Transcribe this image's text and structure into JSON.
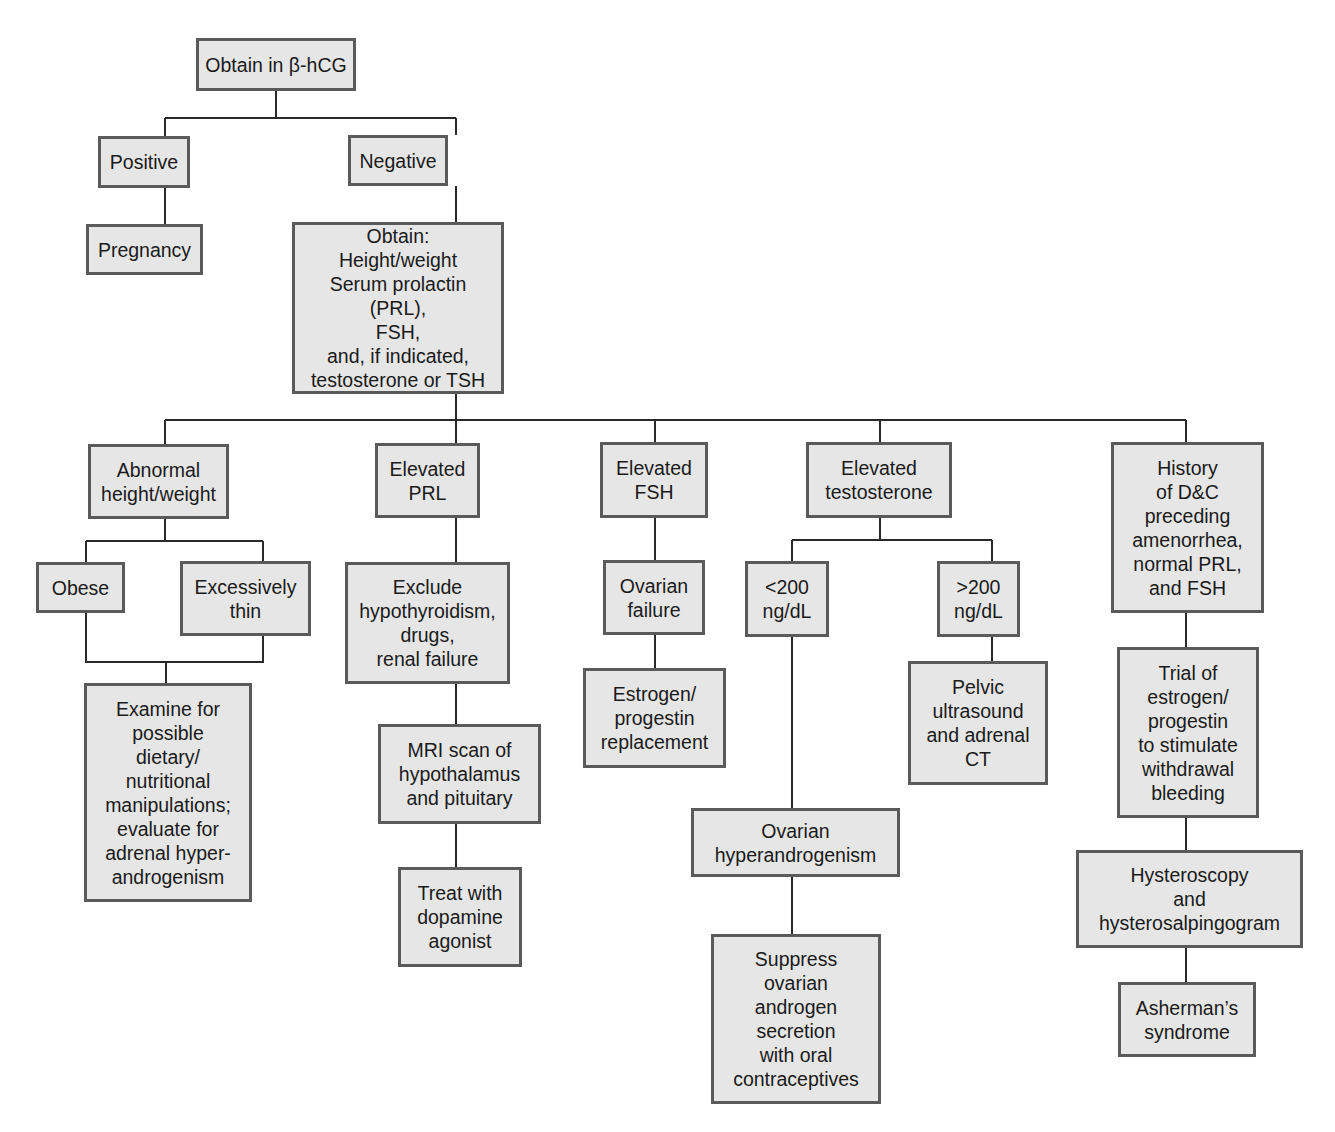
{
  "nodes": [
    {
      "id": "start",
      "text": "Obtain in β-hCG",
      "x": 196,
      "y": 38,
      "w": 160,
      "h": 53
    },
    {
      "id": "positive",
      "text": "Positive",
      "x": 98,
      "y": 136,
      "w": 92,
      "h": 52
    },
    {
      "id": "negative",
      "text": "Negative",
      "x": 348,
      "y": 135,
      "w": 100,
      "h": 51
    },
    {
      "id": "pregnancy",
      "text": "Pregnancy",
      "x": 86,
      "y": 224,
      "w": 117,
      "h": 51
    },
    {
      "id": "obtain",
      "text": "Obtain:\nHeight/weight\nSerum prolactin (PRL),\nFSH,\nand, if indicated,\ntestosterone or TSH",
      "x": 292,
      "y": 222,
      "w": 212,
      "h": 172
    },
    {
      "id": "abnormal",
      "text": "Abnormal\nheight/weight",
      "x": 88,
      "y": 444,
      "w": 141,
      "h": 75
    },
    {
      "id": "elevated-prl",
      "text": "Elevated\nPRL",
      "x": 375,
      "y": 443,
      "w": 105,
      "h": 75
    },
    {
      "id": "elevated-fsh",
      "text": "Elevated\nFSH",
      "x": 600,
      "y": 442,
      "w": 108,
      "h": 76
    },
    {
      "id": "elevated-testosterone",
      "text": "Elevated\ntestosterone",
      "x": 806,
      "y": 442,
      "w": 146,
      "h": 76
    },
    {
      "id": "history-dc",
      "text": "History\nof D&C\npreceding\namenorrhea,\nnormal PRL,\nand FSH",
      "x": 1111,
      "y": 442,
      "w": 153,
      "h": 171
    },
    {
      "id": "obese",
      "text": "Obese",
      "x": 36,
      "y": 562,
      "w": 89,
      "h": 51
    },
    {
      "id": "thin",
      "text": "Excessively\nthin",
      "x": 180,
      "y": 561,
      "w": 131,
      "h": 75
    },
    {
      "id": "exclude",
      "text": "Exclude\nhypothyroidism,\ndrugs,\nrenal failure",
      "x": 345,
      "y": 562,
      "w": 165,
      "h": 122
    },
    {
      "id": "ovarian-failure",
      "text": "Ovarian\nfailure",
      "x": 603,
      "y": 560,
      "w": 102,
      "h": 75
    },
    {
      "id": "lt200",
      "text": "<200\nng/dL",
      "x": 745,
      "y": 561,
      "w": 84,
      "h": 76
    },
    {
      "id": "gt200",
      "text": ">200\nng/dL",
      "x": 937,
      "y": 561,
      "w": 83,
      "h": 76
    },
    {
      "id": "estrogen-replacement",
      "text": "Estrogen/\nprogestin\nreplacement",
      "x": 583,
      "y": 668,
      "w": 143,
      "h": 100
    },
    {
      "id": "pelvic",
      "text": "Pelvic\nultrasound\nand adrenal\nCT",
      "x": 908,
      "y": 661,
      "w": 140,
      "h": 124
    },
    {
      "id": "trial",
      "text": "Trial of\nestrogen/\nprogestin\nto stimulate\nwithdrawal\nbleeding",
      "x": 1117,
      "y": 647,
      "w": 142,
      "h": 171
    },
    {
      "id": "examine",
      "text": "Examine for\npossible\ndietary/\nnutritional\nmanipulations;\nevaluate for\nadrenal hyper-\nandrogenism",
      "x": 84,
      "y": 683,
      "w": 168,
      "h": 219
    },
    {
      "id": "mri",
      "text": "MRI scan of\nhypothalamus\nand pituitary",
      "x": 378,
      "y": 724,
      "w": 163,
      "h": 100
    },
    {
      "id": "ovarian-hyperandrogenism",
      "text": "Ovarian\nhyperandrogenism",
      "x": 691,
      "y": 808,
      "w": 209,
      "h": 69
    },
    {
      "id": "hysteroscopy",
      "text": "Hysteroscopy\nand\nhysterosalpingogram",
      "x": 1076,
      "y": 850,
      "w": 227,
      "h": 98
    },
    {
      "id": "treat",
      "text": "Treat with\ndopamine\nagonist",
      "x": 398,
      "y": 867,
      "w": 124,
      "h": 100
    },
    {
      "id": "suppress",
      "text": "Suppress\novarian\nandrogen\nsecretion\nwith oral\ncontraceptives",
      "x": 711,
      "y": 934,
      "w": 170,
      "h": 170
    },
    {
      "id": "asherman",
      "text": "Asherman’s\nsyndrome",
      "x": 1118,
      "y": 982,
      "w": 138,
      "h": 75
    }
  ],
  "connectors": [
    "M276 91 V118 M165 118 H456 M165 118 V136 M456 118 V135",
    "M165 188 V224",
    "M456 186 V222",
    "M456 394 V420 M165 420 H1186 M165 420 V444 M456 420 V443 M655 420 V442 M880 420 V442 M1186 420 V442",
    "M165 519 V541 M86 541 H263 M86 541 V562 M263 541 V561",
    "M86 613 V662 H263 V636 M166 662 V683",
    "M456 518 V562",
    "M456 684 V724",
    "M456 824 V867",
    "M655 518 V560",
    "M655 635 V668",
    "M880 518 V540 M792 540 H992 M792 540 V561 M992 540 V561",
    "M792 637 V808",
    "M992 637 V661",
    "M792 877 V934",
    "M1186 613 V647",
    "M1186 818 V850",
    "M1186 948 V982"
  ],
  "colors": {
    "box_fill": "#e6e6e6",
    "box_border": "#5a5a5a",
    "line": "#2a2a2a"
  }
}
